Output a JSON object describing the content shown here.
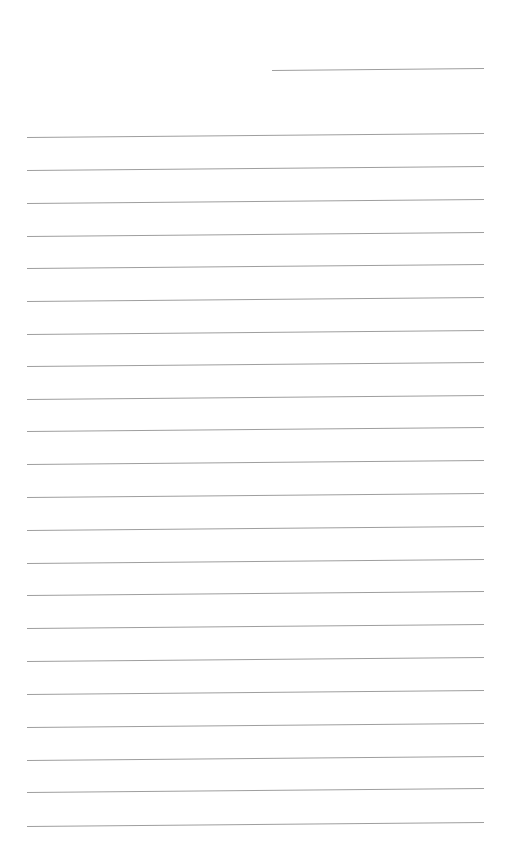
{
  "page": {
    "background": "#ffffff",
    "line_color": "#9e9e9e"
  },
  "header_line": {
    "x1": 272,
    "y1": 70,
    "x2": 484,
    "y2": 68
  },
  "ruled_lines": {
    "x_left": 27,
    "x_right": 484,
    "slope_px": -4,
    "y_left": [
      137,
      170,
      203,
      236,
      268,
      301,
      334,
      366,
      399,
      431,
      464,
      497,
      530,
      563,
      595,
      628,
      661,
      694,
      727,
      760,
      792,
      826
    ]
  }
}
